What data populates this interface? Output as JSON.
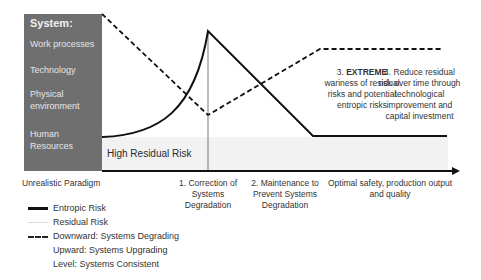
{
  "panel": {
    "title": "System:",
    "items": [
      "Work processes",
      "Technology",
      "Physical environment",
      "Human Resources"
    ]
  },
  "axis_labels": {
    "start": "Unrealistic Paradigm",
    "stage1": "1. Correction of Systems Degradation",
    "stage2": "2. Maintenance to Prevent Systems Degradation",
    "end": "Optimal safety, production output and quality"
  },
  "region_label": "High Residual Risk",
  "annotations": {
    "a3_bold": "EXTREME",
    "a3_prefix": "3.",
    "a3_rest": "wariness of residual risks and potential entropic risks",
    "a4": "4. Reduce residual risk over time through technological improvement and capital investment"
  },
  "legend": [
    {
      "style": "solid-thick",
      "label": "Entropic Risk"
    },
    {
      "style": "solid-light",
      "label": "Residual Risk"
    },
    {
      "style": "dashed",
      "label": "Downward: Systems Degrading"
    },
    {
      "style": "none",
      "label": "Upward: Systems Upgrading"
    },
    {
      "style": "none",
      "label": "Level: Systems Consistent"
    }
  ],
  "colors": {
    "panel": "#6f6f6f",
    "residual_band": "#f2f2f2",
    "lines": "#111111"
  }
}
